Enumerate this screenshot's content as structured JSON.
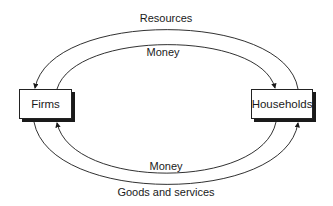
{
  "diagram": {
    "nodes": {
      "firms": "Firms",
      "households": "Households"
    },
    "flows": {
      "resources": "Resources",
      "money_top": "Money",
      "money_bottom": "Money",
      "goods": "Goods and services"
    }
  }
}
